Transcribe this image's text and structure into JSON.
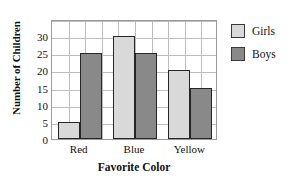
{
  "chart_data": {
    "type": "bar",
    "title": "",
    "xlabel": "Favorite Color",
    "ylabel": "Number of Children",
    "categories": [
      "Red",
      "Blue",
      "Yellow"
    ],
    "series": [
      {
        "name": "Girls",
        "values": [
          5,
          30,
          20
        ],
        "color": "#d9d9d9"
      },
      {
        "name": "Boys",
        "values": [
          25,
          25,
          15
        ],
        "color": "#898989"
      }
    ],
    "ylim": [
      0,
      35
    ],
    "ytick_labels": [
      "0",
      "5",
      "10",
      "15",
      "20",
      "25",
      "30"
    ],
    "ytick_values": [
      0,
      5,
      10,
      15,
      20,
      25,
      30
    ],
    "ygrid_values": [
      0,
      5,
      10,
      15,
      20,
      25,
      30,
      35
    ],
    "xgrid_count": 10,
    "grid": true,
    "legend_position": "right",
    "bar_outline_color": "#262626",
    "grid_color": "#bdbdbd",
    "axis_color": "#9a9a9a"
  },
  "legend": {
    "items": [
      {
        "label": "Girls",
        "swatch": "girls-swatch"
      },
      {
        "label": "Boys",
        "swatch": "boys-swatch"
      }
    ]
  }
}
